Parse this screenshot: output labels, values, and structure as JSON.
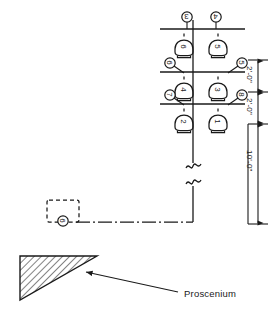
{
  "diagram": {
    "center_line_label": "centerline",
    "break_symbol": "line-break",
    "proscenium_label": "Proscenium",
    "dimensions": [
      {
        "id": "dim-upper",
        "text": "2'-0\"",
        "orientation": "vertical"
      },
      {
        "id": "dim-lower",
        "text": "2'-0\"",
        "orientation": "vertical"
      },
      {
        "id": "dim-drop",
        "text": "10'-0\"",
        "orientation": "vertical"
      }
    ],
    "battens": [
      {
        "id": "batten-top",
        "row": 1,
        "hanger_tags": [
          {
            "label": "3",
            "side": "left"
          },
          {
            "label": "4",
            "side": "right"
          }
        ],
        "fixtures": [
          {
            "label": "6",
            "side": "left"
          },
          {
            "label": "5",
            "side": "right"
          }
        ]
      },
      {
        "id": "batten-middle",
        "row": 2,
        "hanger_tags": [
          {
            "label": "6",
            "side": "left"
          },
          {
            "label": "5",
            "side": "right"
          }
        ],
        "fixtures": [
          {
            "label": "4",
            "side": "left"
          },
          {
            "label": "3",
            "side": "right"
          }
        ]
      },
      {
        "id": "batten-bottom",
        "row": 3,
        "hanger_tags": [
          {
            "label": "7",
            "side": "left"
          },
          {
            "label": "8",
            "side": "right"
          }
        ],
        "fixtures": [
          {
            "label": "2",
            "side": "left"
          },
          {
            "label": "1",
            "side": "right"
          }
        ]
      }
    ],
    "remote_fixture": {
      "id": "remote-dashed-fixture",
      "label": "6",
      "style": "dashed-outline"
    },
    "colors": {
      "line": "#1a1a1a",
      "hatch": "#1a1a1a",
      "background": "#ffffff"
    }
  }
}
